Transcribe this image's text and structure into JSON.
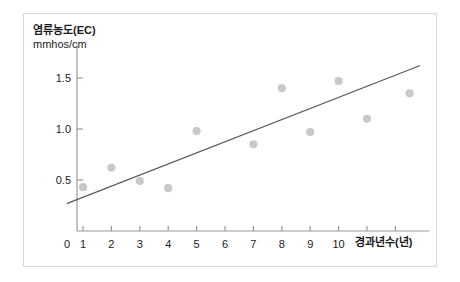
{
  "chart_data": {
    "type": "scatter",
    "title": "",
    "subtitle": "",
    "ylabel": "염류농도(EC)",
    "ylabel_unit": "mmhos/cm",
    "xlabel": "경과년수(년)",
    "xlim": [
      0,
      13.2
    ],
    "ylim": [
      0,
      1.82
    ],
    "grid": false,
    "legend": false,
    "x_ticks": [
      {
        "value": 1,
        "label": "1"
      },
      {
        "value": 2,
        "label": "2"
      },
      {
        "value": 3,
        "label": "3"
      },
      {
        "value": 4,
        "label": "4"
      },
      {
        "value": 5,
        "label": "5"
      },
      {
        "value": 6,
        "label": "6"
      },
      {
        "value": 7,
        "label": "7"
      },
      {
        "value": 8,
        "label": "8"
      },
      {
        "value": 9,
        "label": "9"
      },
      {
        "value": 10,
        "label": "10"
      },
      {
        "value": 11,
        "label": ""
      },
      {
        "value": 12,
        "label": ""
      }
    ],
    "y_ticks": [
      {
        "value": 0.5,
        "label": "0.5"
      },
      {
        "value": 1.0,
        "label": "1.0"
      },
      {
        "value": 1.5,
        "label": "1.5"
      }
    ],
    "origin_label": "0",
    "point_color": "#c9c9c9",
    "line_color": "#5a5a64",
    "axis_color": "#9a9a9a",
    "text_color": "#1a1a1a",
    "frame_color": "#d8d8d8",
    "points": [
      {
        "x": 1,
        "y": 0.43
      },
      {
        "x": 2,
        "y": 0.62
      },
      {
        "x": 3,
        "y": 0.49
      },
      {
        "x": 4,
        "y": 0.42
      },
      {
        "x": 5,
        "y": 0.98
      },
      {
        "x": 7,
        "y": 0.85
      },
      {
        "x": 8,
        "y": 1.4
      },
      {
        "x": 9,
        "y": 0.97
      },
      {
        "x": 10,
        "y": 1.47
      },
      {
        "x": 11,
        "y": 1.1
      },
      {
        "x": 12.5,
        "y": 1.35
      }
    ],
    "trendline": {
      "x_start": 0.45,
      "y_start": 0.27,
      "x_end": 12.85,
      "y_end": 1.62
    }
  }
}
